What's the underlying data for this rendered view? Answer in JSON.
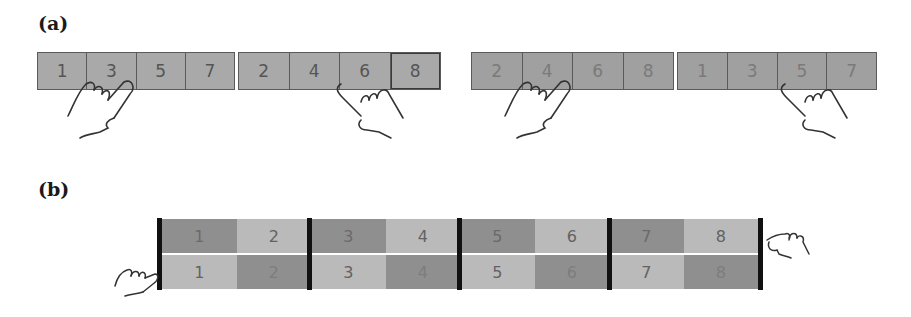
{
  "panels": {
    "a": {
      "label": "(a)",
      "left_group": {
        "strip1": [
          "1",
          "3",
          "5",
          "7"
        ],
        "strip2": [
          "2",
          "4",
          "6",
          "8"
        ]
      },
      "right_group": {
        "strip1": [
          "2",
          "4",
          "6",
          "8"
        ],
        "strip2": [
          "1",
          "3",
          "5",
          "7"
        ]
      }
    },
    "b": {
      "label": "(b)",
      "top_row": [
        "1",
        "2",
        "3",
        "4",
        "5",
        "6",
        "7",
        "8"
      ],
      "bottom_row": [
        "1",
        "2",
        "3",
        "4",
        "5",
        "6",
        "7",
        "8"
      ]
    }
  },
  "icons": [
    "hand-pinch-icon",
    "hand-point-icon"
  ],
  "colors": {
    "cell_dark": "#8f8f8f",
    "cell_light": "#bababa",
    "strip_fill": "#a9a9a9",
    "separator": "#111111"
  }
}
